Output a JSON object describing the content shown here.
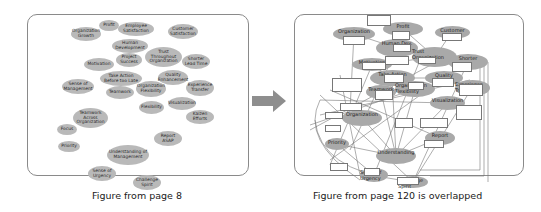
{
  "left_figure": {
    "caption": "Figure from page 8",
    "bubbles": [
      {
        "label": "Profit",
        "x": 99,
        "y": 20,
        "w": 20,
        "h": 11
      },
      {
        "label": "Employee Satisfaction",
        "x": 118,
        "y": 22,
        "w": 36,
        "h": 14
      },
      {
        "label": "Customer Satisfaction",
        "x": 168,
        "y": 24,
        "w": 30,
        "h": 15
      },
      {
        "label": "Organization Growth",
        "x": 71,
        "y": 27,
        "w": 30,
        "h": 14
      },
      {
        "label": "Human Development",
        "x": 112,
        "y": 39,
        "w": 36,
        "h": 14
      },
      {
        "label": "Trust Throughout Organization",
        "x": 145,
        "y": 47,
        "w": 37,
        "h": 20
      },
      {
        "label": "Project Success",
        "x": 116,
        "y": 53,
        "w": 26,
        "h": 14
      },
      {
        "label": "Motivation",
        "x": 84,
        "y": 58,
        "w": 30,
        "h": 13
      },
      {
        "label": "Shorter Lead Time",
        "x": 182,
        "y": 54,
        "w": 28,
        "h": 15
      },
      {
        "label": "Take Action Before too Late",
        "x": 100,
        "y": 71,
        "w": 42,
        "h": 15
      },
      {
        "label": "Quality Enhancement",
        "x": 158,
        "y": 70,
        "w": 30,
        "h": 15
      },
      {
        "label": "Sense of Management",
        "x": 62,
        "y": 79,
        "w": 32,
        "h": 15
      },
      {
        "label": "Teamwork",
        "x": 106,
        "y": 86,
        "w": 28,
        "h": 13
      },
      {
        "label": "Organization Flexibility",
        "x": 136,
        "y": 81,
        "w": 30,
        "h": 16
      },
      {
        "label": "Experience Transfer",
        "x": 186,
        "y": 80,
        "w": 28,
        "h": 16
      },
      {
        "label": "Flexibility",
        "x": 139,
        "y": 101,
        "w": 25,
        "h": 13
      },
      {
        "label": "Visualization",
        "x": 168,
        "y": 97,
        "w": 28,
        "h": 13
      },
      {
        "label": "Kaizen Efforts",
        "x": 186,
        "y": 110,
        "w": 28,
        "h": 14
      },
      {
        "label": "Teamwork Across Organization",
        "x": 73,
        "y": 108,
        "w": 35,
        "h": 20
      },
      {
        "label": "Focus",
        "x": 57,
        "y": 124,
        "w": 20,
        "h": 11
      },
      {
        "label": "Report ASAP",
        "x": 154,
        "y": 131,
        "w": 28,
        "h": 15
      },
      {
        "label": "Priority",
        "x": 58,
        "y": 141,
        "w": 22,
        "h": 11
      },
      {
        "label": "Understanding of Management",
        "x": 107,
        "y": 145,
        "w": 42,
        "h": 20
      },
      {
        "label": "Sense of Urgency",
        "x": 88,
        "y": 166,
        "w": 28,
        "h": 15
      },
      {
        "label": "Challenge Spirit",
        "x": 133,
        "y": 175,
        "w": 28,
        "h": 15
      }
    ]
  },
  "arrow": {
    "direction": "right",
    "color": "#8e8e8e"
  },
  "right_figure": {
    "caption": "Figure from page 120 is overlapped",
    "bubbles": [
      {
        "label": "Organization",
        "x": 333,
        "y": 27,
        "w": 42,
        "h": 14
      },
      {
        "label": "Profit",
        "x": 383,
        "y": 22,
        "w": 40,
        "h": 14
      },
      {
        "label": "Customer",
        "x": 435,
        "y": 26,
        "w": 35,
        "h": 13
      },
      {
        "label": "Human Dev.",
        "x": 376,
        "y": 39,
        "w": 42,
        "h": 18
      },
      {
        "label": "Trust Organization",
        "x": 412,
        "y": 47,
        "w": 45,
        "h": 20
      },
      {
        "label": "Shorter",
        "x": 448,
        "y": 54,
        "w": 40,
        "h": 16
      },
      {
        "label": "Motivation",
        "x": 352,
        "y": 58,
        "w": 40,
        "h": 13
      },
      {
        "label": "Take Action",
        "x": 370,
        "y": 70,
        "w": 45,
        "h": 16
      },
      {
        "label": "Quality",
        "x": 425,
        "y": 71,
        "w": 38,
        "h": 14
      },
      {
        "label": "Organization Flexibility",
        "x": 395,
        "y": 81,
        "w": 40,
        "h": 16
      },
      {
        "label": "Teamwork",
        "x": 366,
        "y": 85,
        "w": 30,
        "h": 14
      },
      {
        "label": "Experience Transfer",
        "x": 455,
        "y": 80,
        "w": 35,
        "h": 16
      },
      {
        "label": "Organization",
        "x": 342,
        "y": 110,
        "w": 40,
        "h": 16
      },
      {
        "label": "Visualization",
        "x": 430,
        "y": 96,
        "w": 35,
        "h": 14
      },
      {
        "label": "Report",
        "x": 425,
        "y": 131,
        "w": 30,
        "h": 14
      },
      {
        "label": "Understanding",
        "x": 376,
        "y": 148,
        "w": 40,
        "h": 16
      },
      {
        "label": "Priority",
        "x": 325,
        "y": 138,
        "w": 24,
        "h": 12
      },
      {
        "label": "Sense of Urgency",
        "x": 360,
        "y": 168,
        "w": 28,
        "h": 14
      },
      {
        "label": "Challenge Spirit",
        "x": 398,
        "y": 176,
        "w": 30,
        "h": 12
      }
    ]
  }
}
